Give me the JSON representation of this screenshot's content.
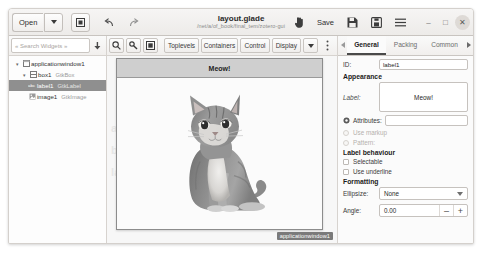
{
  "window": {
    "title": "layout.glade",
    "subtitle": "/net/a/of_book/final_tem/zotero-gui"
  },
  "headerbar": {
    "open_label": "Open",
    "open_dropdown_icon": "chevron-down-icon",
    "new_window_icon": "new-window-icon",
    "undo_icon": "undo-icon",
    "redo_icon": "redo-icon",
    "pointer_icon": "pointer-hand-icon",
    "save_label": "Save",
    "save_icon": "save-disk-icon",
    "save_as_icon": "save-as-icon",
    "menu_icon": "hamburger-menu-icon",
    "minimize_label": "–",
    "maximize_label": "□",
    "close_label": "✕"
  },
  "left_panel": {
    "search": {
      "placeholder": "« Search Widgets »",
      "dropdown_icon": "arrow-down-icon"
    },
    "tree": [
      {
        "name": "applicationwindow1",
        "class": "",
        "depth": 0,
        "expander": "▾",
        "icon": "window-icon",
        "selected": false
      },
      {
        "name": "box1",
        "class": "GtkBox",
        "depth": 1,
        "expander": "▾",
        "icon": "box-icon",
        "selected": false
      },
      {
        "name": "label1",
        "class": "GtkLabel",
        "depth": 2,
        "expander": "",
        "icon": "label-icon",
        "selected": true
      },
      {
        "name": "image1",
        "class": "GtkImage",
        "depth": 2,
        "expander": "",
        "icon": "image-icon",
        "selected": false
      }
    ]
  },
  "toolbar": {
    "search_icon": "magnifier-icon",
    "pointer_icon": "select-pointer-icon",
    "preview_icon": "preview-icon",
    "groups": [
      "Toplevels",
      "Containers",
      "Control",
      "Display"
    ],
    "more_icon": "chevron-down-icon",
    "kebab_icon": "kebab-menu-icon"
  },
  "canvas": {
    "label_text": "Meow!",
    "image_icon": "cat-photo",
    "badge": "applicationwindow1",
    "ghost_lines": [
      "applicationwindow1",
      "box1",
      "label1 image1"
    ]
  },
  "right_panel": {
    "tab_prev_icon": "chevron-left-icon",
    "tab_next_icon": "chevron-right-icon",
    "tabs": [
      {
        "label": "General",
        "active": true
      },
      {
        "label": "Packing",
        "active": false
      },
      {
        "label": "Common",
        "active": false
      }
    ],
    "id_label": "ID:",
    "id_value": "label1",
    "appearance_heading": "Appearance",
    "label_label": "Label:",
    "label_value": "Meow!",
    "attributes_label": "Attributes:",
    "attributes_icon": "gear-icon",
    "use_markup_label": "Use markup",
    "pattern_label": "Pattern:",
    "behaviour_heading": "Label behaviour",
    "selectable_label": "Selectable",
    "use_underline_label": "Use underline",
    "formatting_heading": "Formatting",
    "ellipsize_label": "Ellipsize:",
    "ellipsize_value": "None",
    "ellipsize_icon": "chevron-down-icon",
    "angle_label": "Angle:",
    "angle_value": "0.00",
    "angle_minus": "–",
    "angle_plus": "+"
  },
  "colors": {
    "accent": "#4a4a4a",
    "selection": "#8f8f8f",
    "badge": "#7a7a7a",
    "label_bg": "#cfcfcf"
  }
}
